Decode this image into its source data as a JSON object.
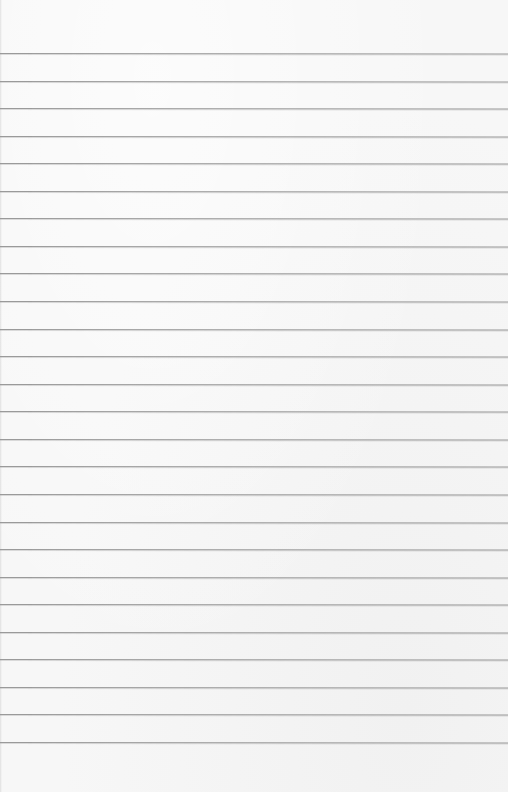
{
  "paper": {
    "type": "lined-paper",
    "background_color": "#f7f7f7",
    "line_color": "#9a9a9a",
    "line_count": 26,
    "first_line_y": 53,
    "line_spacing": 27.1,
    "line_positions": [
      53,
      81,
      108,
      135,
      162,
      189,
      216,
      243,
      270,
      297,
      325,
      352,
      379,
      406,
      433,
      460,
      487,
      514,
      541,
      568,
      596,
      623,
      650,
      687,
      714,
      742
    ]
  }
}
